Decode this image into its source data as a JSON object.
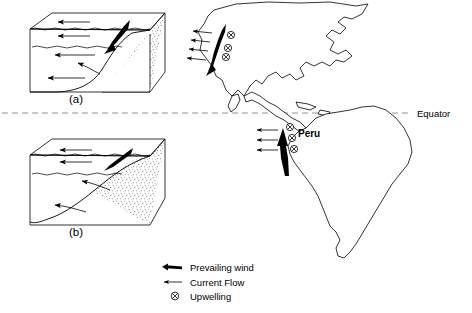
{
  "figure": {
    "equator_label": "Equator",
    "panels": [
      {
        "id": "a",
        "label": "(a)",
        "description": "Block diagram of steep coastal shelf with offshore prevailing wind and surface current flow"
      },
      {
        "id": "b",
        "label": "(b)",
        "description": "Block diagram of gentle coastal shelf with alongshore prevailing wind and surface current flow"
      }
    ]
  },
  "map": {
    "place_labels": [
      {
        "name": "Peru",
        "text": "Peru"
      }
    ],
    "regions": [
      {
        "name": "north-america",
        "fill": "hatched"
      },
      {
        "name": "south-america",
        "fill": "hatched"
      }
    ],
    "upwelling_sites": [
      {
        "name": "california-upwelling",
        "count": 2
      },
      {
        "name": "peru-upwelling",
        "count": 3
      }
    ]
  },
  "legend": {
    "items": [
      {
        "icon": "thick-arrow-icon",
        "label": "Prevailing wind"
      },
      {
        "icon": "thin-arrow-icon",
        "label": "Current Flow"
      },
      {
        "icon": "upwelling-icon",
        "label": "Upwelling"
      }
    ]
  },
  "colors": {
    "ink": "#000000",
    "paper": "#ffffff",
    "equator_dash": "#888888",
    "hatch": "#555555",
    "stipple": "#6b6b6b"
  }
}
